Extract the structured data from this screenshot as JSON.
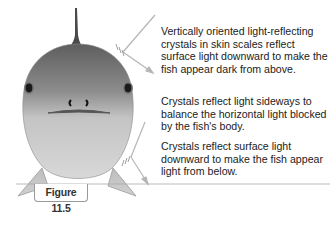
{
  "figure": {
    "label": "Figure 11.5",
    "annotations": [
      {
        "id": "top",
        "text": "Vertically oriented light-reflecting crystals in skin scales reflect surface light downward to make the fish appear dark from above."
      },
      {
        "id": "side",
        "text": "Crystals reflect light sideways to balance the horizontal light blocked by the fish's body."
      },
      {
        "id": "bottom",
        "text": "Crystals reflect surface light downward to make the fish appear light from below."
      }
    ],
    "colors": {
      "body_top": "#6e6e6e",
      "body_bottom": "#d4d4d4",
      "arrow": "#b5b5b5",
      "eye": "#1a1a1a"
    }
  }
}
